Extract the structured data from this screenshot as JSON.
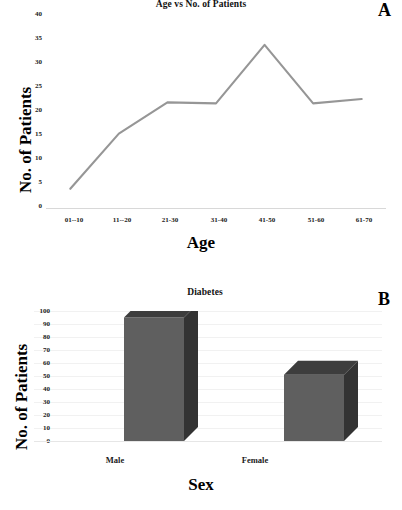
{
  "figure": {
    "panels": [
      {
        "letter": "A"
      },
      {
        "letter": "B"
      }
    ]
  },
  "chart_data": [
    {
      "type": "line",
      "panel": "A",
      "title": "Age vs No. of Patients",
      "xlabel": "Age",
      "ylabel": "No. of Patients",
      "categories": [
        "01--10",
        "11--20",
        "21-30",
        "31-40",
        "41-50",
        "51-60",
        "61-70"
      ],
      "values": [
        4,
        15.5,
        22,
        21.8,
        34,
        21.8,
        22.7
      ],
      "yticks": [
        0,
        5,
        10,
        15,
        20,
        25,
        30,
        35,
        40
      ],
      "ylim": [
        0,
        40
      ],
      "grid": false,
      "legend": "none",
      "series_color": "#969696"
    },
    {
      "type": "bar",
      "panel": "B",
      "title": "Diabetes",
      "xlabel": "Sex",
      "ylabel": "No. of Patients",
      "categories": [
        "Male",
        "Female"
      ],
      "values": [
        95,
        51
      ],
      "yticks": [
        0,
        10,
        20,
        30,
        40,
        50,
        60,
        70,
        80,
        90,
        100
      ],
      "ylim": [
        0,
        100
      ],
      "grid": true,
      "legend": "none",
      "bar_face_color": "#5f5f5f",
      "bar_side_color": "#333333",
      "bar_top_color": "#3d3d3d",
      "three_d": true
    }
  ]
}
